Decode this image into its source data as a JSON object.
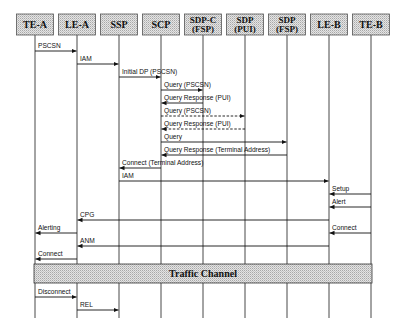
{
  "diagram": {
    "type": "sequence",
    "participants": [
      {
        "id": "TE-A",
        "lines": [
          "TE-A"
        ]
      },
      {
        "id": "LE-A",
        "lines": [
          "LE-A"
        ]
      },
      {
        "id": "SSP",
        "lines": [
          "SSP"
        ]
      },
      {
        "id": "SCP",
        "lines": [
          "SCP"
        ]
      },
      {
        "id": "SDP-C (FSP)",
        "lines": [
          "SDP-C",
          "(FSP)"
        ]
      },
      {
        "id": "SDP (PUI)",
        "lines": [
          "SDP",
          "(PUI)"
        ]
      },
      {
        "id": "SDP (FSP)",
        "lines": [
          "SDP",
          "(FSP)"
        ]
      },
      {
        "id": "LE-B",
        "lines": [
          "LE-B"
        ]
      },
      {
        "id": "TE-B",
        "lines": [
          "TE-B"
        ]
      }
    ],
    "messages": [
      {
        "label": "PSCSN",
        "from": 0,
        "to": 1,
        "style": "solid",
        "y": 51
      },
      {
        "label": "IAM",
        "from": 1,
        "to": 2,
        "style": "solid",
        "y": 64
      },
      {
        "label": "Initial DP (PSCSN)",
        "from": 2,
        "to": 3,
        "style": "solid",
        "y": 77
      },
      {
        "label": "Query (PSCSN)",
        "from": 3,
        "to": 4,
        "style": "solid",
        "y": 90
      },
      {
        "label": "Query Response (PUI)",
        "from": 4,
        "to": 3,
        "style": "solid",
        "y": 103
      },
      {
        "label": "Query (PSCSN)",
        "from": 3,
        "to": 5,
        "style": "dashed",
        "y": 116
      },
      {
        "label": "Query Response (PUI)",
        "from": 5,
        "to": 3,
        "style": "dashed",
        "y": 129
      },
      {
        "label": "Query",
        "from": 3,
        "to": 6,
        "style": "solid",
        "y": 142
      },
      {
        "label": "Query Response (Terminal Address)",
        "from": 6,
        "to": 3,
        "style": "solid",
        "y": 155
      },
      {
        "label": "Connect (Terminal Address)",
        "from": 3,
        "to": 2,
        "style": "solid",
        "y": 168
      },
      {
        "label": "IAM",
        "from": 2,
        "to": 7,
        "style": "solid",
        "y": 181
      },
      {
        "label": "Setup",
        "from": 8,
        "to": 7,
        "style": "solid",
        "y": 194
      },
      {
        "label": "Alert",
        "from": 8,
        "to": 7,
        "style": "solid",
        "y": 207
      },
      {
        "label": "CPG",
        "from": 7,
        "to": 1,
        "style": "solid",
        "y": 220
      },
      {
        "label": "Alerting",
        "from": 1,
        "to": 0,
        "style": "solid",
        "y": 233
      },
      {
        "label": "Connect",
        "from": 8,
        "to": 7,
        "style": "solid",
        "y": 233
      },
      {
        "label": "ANM",
        "from": 7,
        "to": 1,
        "style": "solid",
        "y": 246
      },
      {
        "label": "Connect",
        "from": 1,
        "to": 0,
        "style": "solid",
        "y": 259
      },
      {
        "label": "Disconnect",
        "from": 0,
        "to": 1,
        "style": "solid",
        "y": 297
      },
      {
        "label": "REL",
        "from": 1,
        "to": 2,
        "style": "solid",
        "y": 310
      }
    ],
    "band": {
      "label": "Traffic Channel",
      "from": 0,
      "to": 8,
      "y": 264,
      "height": 19
    }
  }
}
